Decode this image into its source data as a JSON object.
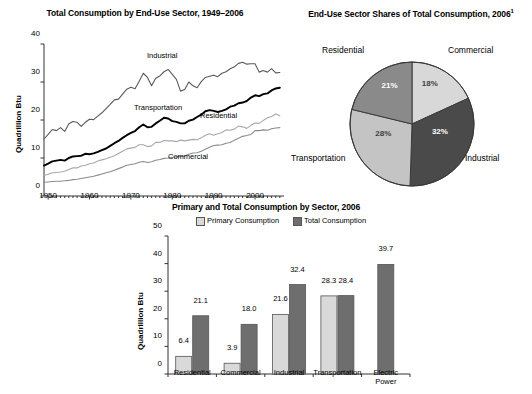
{
  "colors": {
    "industrial_line": "#5a5a5a",
    "transportation_line": "#000000",
    "residential_line": "#a8a8a8",
    "commercial_line": "#8c8c8c",
    "pie_commercial": "#d8d8d8",
    "pie_industrial": "#4a4a4a",
    "pie_transportation": "#c4c4c4",
    "pie_residential": "#8a8a8a",
    "bar_primary": "#d9d9d9",
    "bar_total": "#6e6e6e",
    "axis": "#333333"
  },
  "line_chart": {
    "title": "Total Consumption by End-Use Sector, 1949–2006",
    "ylabel": "Quadrillion Btu",
    "yticks": [
      "0",
      "10",
      "20",
      "30",
      "40"
    ],
    "xticks": [
      "1950",
      "1960",
      "1970",
      "1980",
      "1990",
      "2000"
    ],
    "series_labels": {
      "industrial": "Industrial",
      "transportation": "Transportation",
      "residential": "Residential",
      "commercial": "Commercial"
    }
  },
  "pie_chart": {
    "title": "End-Use Sector Shares of Total Consumption, 2006",
    "title_footnote": "1",
    "labels": {
      "residential": "Residential",
      "commercial": "Commercial",
      "industrial": "Industrial",
      "transportation": "Transportation"
    },
    "percent_labels": {
      "commercial": "18%",
      "industrial": "32%",
      "transportation": "28%",
      "residential": "21%"
    }
  },
  "bar_chart": {
    "title": "Primary and Total Consumption by Sector, 2006",
    "ylabel": "Quadrillion Btu",
    "yticks": [
      "0",
      "10",
      "20",
      "30",
      "40",
      "50"
    ],
    "legend": {
      "primary": "Primary Consumption",
      "total": "Total Consumption"
    },
    "categories": [
      "Residential",
      "Commercial",
      "Industrial",
      "Transportation",
      "Electric Power"
    ],
    "value_labels": {
      "primary": [
        "6.4",
        "3.9",
        "21.6",
        "28.3",
        ""
      ],
      "total": [
        "21.1",
        "18.0",
        "32.4",
        "28.4",
        "39.7"
      ]
    }
  },
  "chart_data": [
    {
      "type": "line",
      "title": "Total Consumption by End-Use Sector, 1949–2006",
      "xlabel": "",
      "ylabel": "Quadrillion Btu",
      "ylim": [
        0,
        40
      ],
      "xlim": [
        1949,
        2006
      ],
      "grid": false,
      "legend_position": "inline-labels",
      "x": [
        1949,
        1950,
        1951,
        1952,
        1953,
        1954,
        1955,
        1956,
        1957,
        1958,
        1959,
        1960,
        1961,
        1962,
        1963,
        1964,
        1965,
        1966,
        1967,
        1968,
        1969,
        1970,
        1971,
        1972,
        1973,
        1974,
        1975,
        1976,
        1977,
        1978,
        1979,
        1980,
        1981,
        1982,
        1983,
        1984,
        1985,
        1986,
        1987,
        1988,
        1989,
        1990,
        1991,
        1992,
        1993,
        1994,
        1995,
        1996,
        1997,
        1998,
        1999,
        2000,
        2001,
        2002,
        2003,
        2004,
        2005,
        2006
      ],
      "series": [
        {
          "name": "Industrial",
          "values": [
            15.0,
            16.2,
            17.5,
            17.2,
            18.0,
            17.0,
            19.0,
            19.6,
            19.4,
            18.3,
            19.4,
            20.2,
            20.1,
            21.0,
            21.9,
            23.0,
            24.1,
            25.3,
            25.5,
            26.8,
            28.1,
            28.6,
            28.2,
            30.2,
            32.3,
            31.2,
            29.0,
            31.0,
            31.6,
            32.7,
            33.3,
            32.0,
            30.7,
            27.6,
            28.0,
            30.0,
            29.0,
            28.5,
            30.1,
            31.2,
            31.5,
            31.8,
            31.4,
            32.3,
            32.7,
            33.5,
            34.0,
            34.9,
            35.2,
            34.7,
            34.8,
            34.8,
            32.6,
            33.0,
            32.6,
            33.5,
            32.4,
            32.5
          ]
        },
        {
          "name": "Transportation",
          "values": [
            8.0,
            8.5,
            9.1,
            9.3,
            9.5,
            9.3,
            10.0,
            10.4,
            10.5,
            10.6,
            11.1,
            11.0,
            11.2,
            11.6,
            12.1,
            12.5,
            13.2,
            13.9,
            14.5,
            15.3,
            16.0,
            16.6,
            17.1,
            18.1,
            18.8,
            18.1,
            18.2,
            19.1,
            19.8,
            20.6,
            20.4,
            19.7,
            19.5,
            19.1,
            19.1,
            19.8,
            20.1,
            20.8,
            21.4,
            22.3,
            22.6,
            22.4,
            22.1,
            22.4,
            22.8,
            23.5,
            23.8,
            24.4,
            24.6,
            25.0,
            25.9,
            26.5,
            26.3,
            26.8,
            27.0,
            27.8,
            28.3,
            28.5
          ]
        },
        {
          "name": "Residential",
          "values": [
            5.4,
            5.7,
            6.1,
            6.2,
            6.3,
            6.5,
            7.0,
            7.4,
            7.4,
            7.9,
            8.1,
            8.5,
            8.7,
            9.2,
            9.5,
            9.8,
            10.2,
            10.6,
            11.2,
            11.8,
            12.4,
            12.6,
            12.8,
            13.5,
            13.5,
            13.0,
            13.2,
            14.1,
            14.1,
            14.6,
            14.5,
            14.5,
            14.3,
            14.7,
            14.5,
            14.7,
            14.9,
            14.8,
            15.3,
            16.0,
            16.4,
            16.0,
            16.4,
            16.7,
            17.4,
            17.3,
            17.6,
            18.4,
            18.2,
            17.8,
            18.6,
            19.2,
            19.1,
            19.9,
            20.6,
            20.9,
            21.6,
            21.1
          ]
        },
        {
          "name": "Commercial",
          "values": [
            3.6,
            3.7,
            3.8,
            3.9,
            3.9,
            4.0,
            4.1,
            4.3,
            4.4,
            4.6,
            4.8,
            5.0,
            5.2,
            5.5,
            5.8,
            6.1,
            6.4,
            6.8,
            7.2,
            7.6,
            8.1,
            8.3,
            8.5,
            8.9,
            9.1,
            8.8,
            9.0,
            9.4,
            9.6,
            9.9,
            10.0,
            10.2,
            10.3,
            10.4,
            10.5,
            11.0,
            11.3,
            11.4,
            11.8,
            12.3,
            12.8,
            13.3,
            13.4,
            13.5,
            13.9,
            14.1,
            14.7,
            15.2,
            15.7,
            15.9,
            16.2,
            17.2,
            17.2,
            17.4,
            17.3,
            17.7,
            17.9,
            18.0
          ]
        }
      ]
    },
    {
      "type": "pie",
      "title": "End-Use Sector Shares of Total Consumption, 2006",
      "labels": [
        "Commercial",
        "Industrial",
        "Transportation",
        "Residential"
      ],
      "values": [
        18,
        32,
        28,
        21
      ],
      "legend_position": "outside-labels"
    },
    {
      "type": "bar",
      "title": "Primary and Total Consumption by Sector, 2006",
      "xlabel": "",
      "ylabel": "Quadrillion Btu",
      "ylim": [
        0,
        50
      ],
      "grid": false,
      "legend_position": "top",
      "categories": [
        "Residential",
        "Commercial",
        "Industrial",
        "Transportation",
        "Electric Power"
      ],
      "series": [
        {
          "name": "Primary Consumption",
          "values": [
            6.4,
            3.9,
            21.6,
            28.3,
            null
          ]
        },
        {
          "name": "Total Consumption",
          "values": [
            21.1,
            18.0,
            32.4,
            28.4,
            39.7
          ]
        }
      ]
    }
  ]
}
